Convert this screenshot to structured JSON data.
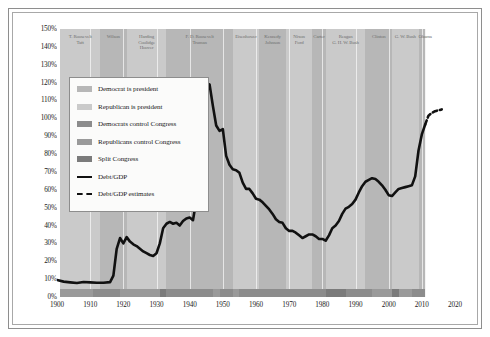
{
  "chart_data": {
    "type": "line",
    "title": "",
    "xlabel": "",
    "ylabel": "",
    "xlim": [
      1900,
      2020
    ],
    "ylim": [
      0,
      150
    ],
    "ytick_labels": [
      "0%",
      "10%",
      "20%",
      "30%",
      "40%",
      "50%",
      "60%",
      "70%",
      "80%",
      "90%",
      "100%",
      "110%",
      "120%",
      "130%",
      "140%",
      "150%"
    ],
    "ytick_values": [
      0,
      10,
      20,
      30,
      40,
      50,
      60,
      70,
      80,
      90,
      100,
      110,
      120,
      130,
      140,
      150
    ],
    "xtick_labels": [
      "1900",
      "1910",
      "1920",
      "1930",
      "1940",
      "1950",
      "1960",
      "1970",
      "1980",
      "1990",
      "2000",
      "2010",
      "2020"
    ],
    "xtick_values": [
      1900,
      1910,
      1920,
      1930,
      1940,
      1950,
      1960,
      1970,
      1980,
      1990,
      2000,
      2010,
      2020
    ],
    "grid": "vertical-light",
    "legend_position": "upper-left-inset",
    "series": [
      {
        "name": "Debt/GDP",
        "style": "solid",
        "color": "#111111",
        "x": [
          1900,
          1902,
          1904,
          1906,
          1908,
          1910,
          1912,
          1914,
          1916,
          1917,
          1918,
          1919,
          1920,
          1921,
          1922,
          1923,
          1924,
          1925,
          1926,
          1927,
          1928,
          1929,
          1930,
          1931,
          1932,
          1933,
          1934,
          1935,
          1936,
          1937,
          1938,
          1939,
          1940,
          1941,
          1942,
          1943,
          1944,
          1945,
          1946,
          1947,
          1948,
          1949,
          1950,
          1951,
          1952,
          1953,
          1954,
          1955,
          1956,
          1957,
          1958,
          1959,
          1960,
          1961,
          1962,
          1963,
          1964,
          1965,
          1966,
          1967,
          1968,
          1969,
          1970,
          1971,
          1972,
          1973,
          1974,
          1975,
          1976,
          1977,
          1978,
          1979,
          1980,
          1981,
          1982,
          1983,
          1984,
          1985,
          1986,
          1987,
          1988,
          1989,
          1990,
          1991,
          1992,
          1993,
          1994,
          1995,
          1996,
          1997,
          1998,
          1999,
          2000,
          2001,
          2002,
          2003,
          2004,
          2005,
          2006,
          2007,
          2008,
          2009,
          2010,
          2011
        ],
        "y": [
          9.5,
          8.6,
          8.2,
          7.8,
          8.4,
          8.2,
          8.0,
          8.0,
          8.3,
          12.0,
          27.0,
          33.0,
          30.0,
          33.5,
          31.0,
          29.5,
          28.5,
          27.0,
          25.5,
          24.5,
          23.5,
          23.0,
          24.5,
          30.0,
          38.5,
          41.0,
          42.0,
          41.0,
          41.5,
          40.0,
          42.5,
          44.0,
          44.5,
          43.0,
          54.0,
          78.0,
          97.0,
          114.0,
          119.0,
          107.0,
          96.0,
          93.0,
          94.0,
          79.0,
          74.0,
          71.5,
          71.0,
          69.5,
          64.0,
          60.5,
          60.5,
          58.0,
          55.0,
          54.5,
          53.0,
          51.0,
          49.0,
          46.5,
          43.5,
          42.0,
          41.5,
          38.5,
          37.0,
          37.0,
          36.0,
          34.5,
          33.0,
          34.0,
          35.0,
          35.0,
          34.0,
          32.5,
          32.5,
          31.5,
          34.5,
          38.5,
          40.0,
          42.5,
          46.5,
          49.5,
          50.5,
          52.0,
          54.5,
          58.5,
          62.0,
          64.5,
          65.5,
          66.5,
          66.0,
          64.5,
          62.5,
          60.0,
          57.0,
          56.5,
          58.5,
          60.5,
          61.0,
          61.5,
          62.0,
          62.5,
          67.5,
          82.0,
          91.0,
          96.5
        ]
      },
      {
        "name": "Debt/GDP estimates",
        "style": "dashed",
        "color": "#111111",
        "x": [
          2011,
          2012,
          2013,
          2014,
          2015,
          2016
        ],
        "y": [
          96.5,
          101.5,
          103.0,
          104.0,
          104.5,
          105.0
        ]
      }
    ],
    "legend": [
      {
        "label": "Democrat is president",
        "swatch": "#b7b7b7",
        "type": "swatch"
      },
      {
        "label": "Republican is president",
        "swatch": "#cacaca",
        "type": "swatch"
      },
      {
        "label": "Democrats control Congress",
        "swatch": "#8c8c8c",
        "type": "swatch"
      },
      {
        "label": "Republicans control Congress",
        "swatch": "#9a9a9a",
        "type": "swatch"
      },
      {
        "label": "Split Congress",
        "swatch": "#7b7b7b",
        "type": "swatch"
      },
      {
        "label": "Debt/GDP",
        "swatch": "#111111",
        "type": "line"
      },
      {
        "label": "Debt/GDP estimates",
        "swatch": "#111111",
        "type": "dashed"
      }
    ],
    "president_bands": [
      {
        "label": "T. Roosevelt\nTaft",
        "start": 1901,
        "end": 1913,
        "party": "republican",
        "fill": "#cacaca"
      },
      {
        "label": "Wilson",
        "start": 1913,
        "end": 1921,
        "party": "democrat",
        "fill": "#b7b7b7"
      },
      {
        "label": "Harding\nCoolidge\nHoover",
        "start": 1921,
        "end": 1933,
        "party": "republican",
        "fill": "#cacaca"
      },
      {
        "label": "F. D. Roosevelt\nTruman",
        "start": 1933,
        "end": 1953,
        "party": "democrat",
        "fill": "#b7b7b7"
      },
      {
        "label": "Eisenhower",
        "start": 1953,
        "end": 1961,
        "party": "republican",
        "fill": "#cacaca"
      },
      {
        "label": "Kennedy\nJohnson",
        "start": 1961,
        "end": 1969,
        "party": "democrat",
        "fill": "#b7b7b7"
      },
      {
        "label": "Nixon\nFord",
        "start": 1969,
        "end": 1977,
        "party": "republican",
        "fill": "#cacaca"
      },
      {
        "label": "Carter",
        "start": 1977,
        "end": 1981,
        "party": "democrat",
        "fill": "#b7b7b7"
      },
      {
        "label": "Reagan\nG. H. W. Bush",
        "start": 1981,
        "end": 1993,
        "party": "republican",
        "fill": "#cacaca"
      },
      {
        "label": "Clinton",
        "start": 1993,
        "end": 2001,
        "party": "democrat",
        "fill": "#b7b7b7"
      },
      {
        "label": "G. W. Bush",
        "start": 2001,
        "end": 2009,
        "party": "republican",
        "fill": "#cacaca"
      },
      {
        "label": "Obama",
        "start": 2009,
        "end": 2011,
        "party": "democrat",
        "fill": "#b7b7b7"
      }
    ],
    "congress_bands": [
      {
        "start": 1901,
        "end": 1911,
        "control": "republican",
        "fill": "#9a9a9a"
      },
      {
        "start": 1911,
        "end": 1919,
        "control": "democrat",
        "fill": "#8c8c8c"
      },
      {
        "start": 1919,
        "end": 1931,
        "control": "republican",
        "fill": "#9a9a9a"
      },
      {
        "start": 1931,
        "end": 1933,
        "control": "split",
        "fill": "#7b7b7b"
      },
      {
        "start": 1933,
        "end": 1947,
        "control": "democrat",
        "fill": "#8c8c8c"
      },
      {
        "start": 1947,
        "end": 1949,
        "control": "republican",
        "fill": "#9a9a9a"
      },
      {
        "start": 1949,
        "end": 1953,
        "control": "democrat",
        "fill": "#8c8c8c"
      },
      {
        "start": 1953,
        "end": 1955,
        "control": "republican",
        "fill": "#9a9a9a"
      },
      {
        "start": 1955,
        "end": 1981,
        "control": "democrat",
        "fill": "#8c8c8c"
      },
      {
        "start": 1981,
        "end": 1987,
        "control": "split",
        "fill": "#7b7b7b"
      },
      {
        "start": 1987,
        "end": 1995,
        "control": "democrat",
        "fill": "#8c8c8c"
      },
      {
        "start": 1995,
        "end": 2001,
        "control": "republican",
        "fill": "#9a9a9a"
      },
      {
        "start": 2001,
        "end": 2003,
        "control": "split",
        "fill": "#7b7b7b"
      },
      {
        "start": 2003,
        "end": 2007,
        "control": "republican",
        "fill": "#9a9a9a"
      },
      {
        "start": 2007,
        "end": 2011,
        "control": "democrat",
        "fill": "#8c8c8c"
      }
    ]
  }
}
